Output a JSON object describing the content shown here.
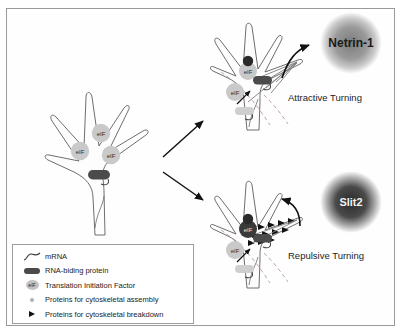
{
  "figure": {
    "title_present": false,
    "background": "#ffffff",
    "border_color": "#9a9a9a"
  },
  "panels": {
    "center": {
      "name": "resting growth cone",
      "eif_count": 3,
      "eif_label": "eIF",
      "rbp_present": true
    },
    "attractive": {
      "cue_label": "Netrin-1",
      "turning_label": "Attractive Turning",
      "cue_fill": "#8e8e8e",
      "cue_text_color": "#1a1a1a",
      "eif_label": "eIF",
      "marker": "cytoskeletal assembly"
    },
    "repulsive": {
      "cue_label": "Slit2",
      "turning_label": "Repulsive Turning",
      "cue_fill": "#3b3b3b",
      "cue_text_color": "#f2f2f2",
      "eif_label": "eIF",
      "marker": "cytoskeletal breakdown"
    }
  },
  "legend": {
    "items": [
      {
        "icon": "mrna-squiggle-icon",
        "label": "mRNA"
      },
      {
        "icon": "rna-binding-protein-icon",
        "label": "RNA-biding protein"
      },
      {
        "icon": "translation-initiation-factor-icon",
        "icon_text": "eIF",
        "label": "Translation Initiation Factor"
      },
      {
        "icon": "assembly-dot-icon",
        "label": "Proteins for cytoskeletal assembly"
      },
      {
        "icon": "breakdown-triangle-icon",
        "label": "Proteins for cytoskeletal breakdown"
      }
    ]
  }
}
